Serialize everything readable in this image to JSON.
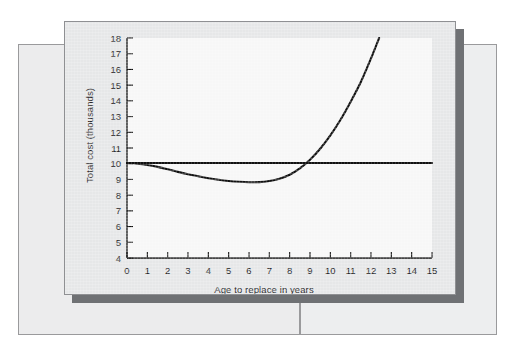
{
  "figure": {
    "kind": "line-chart-figure",
    "card_background": "#e6e7e8",
    "plot_background": "#f7f7f7",
    "shadow_color": "#6f7174",
    "line_color": "#111111"
  },
  "chart_data": {
    "type": "line",
    "title": "",
    "xlabel": "Age to replace in years",
    "ylabel": "Total cost (thousands)",
    "xlim": [
      0,
      15
    ],
    "ylim": [
      4,
      18
    ],
    "xticks": [
      0,
      1,
      2,
      3,
      4,
      5,
      6,
      7,
      8,
      9,
      10,
      11,
      12,
      13,
      14,
      15
    ],
    "yticks": [
      4,
      5,
      6,
      7,
      8,
      9,
      10,
      11,
      12,
      13,
      14,
      15,
      16,
      17,
      18
    ],
    "xtick_labels": [
      "0",
      "1",
      "2",
      "3",
      "4",
      "5",
      "6",
      "7",
      "8",
      "9",
      "10",
      "11",
      "12",
      "13",
      "14",
      "15"
    ],
    "ytick_labels": [
      "4",
      "5",
      "6",
      "7",
      "8",
      "9",
      "10",
      "11",
      "12",
      "13",
      "14",
      "15",
      "16",
      "17",
      "18"
    ],
    "grid": false,
    "legend": null,
    "series": [
      {
        "name": "Reference cost line",
        "style": "straight-horizontal",
        "color": "#111111",
        "x": [
          0,
          15
        ],
        "values": [
          10.05,
          10.05
        ]
      },
      {
        "name": "Total cost curve",
        "style": "smooth-curve",
        "color": "#111111",
        "x": [
          0,
          0.5,
          1,
          1.5,
          2,
          2.5,
          3,
          3.5,
          4,
          4.5,
          5,
          5.5,
          6,
          6.5,
          7,
          7.5,
          8,
          8.5,
          9,
          9.5,
          10,
          10.5,
          11,
          11.5,
          12,
          12.4
        ],
        "values": [
          10.05,
          10.0,
          9.92,
          9.8,
          9.65,
          9.48,
          9.33,
          9.2,
          9.08,
          8.98,
          8.9,
          8.85,
          8.82,
          8.83,
          8.9,
          9.05,
          9.3,
          9.7,
          10.25,
          10.95,
          11.8,
          12.8,
          13.95,
          15.2,
          16.7,
          18.0
        ]
      }
    ],
    "annotations": {
      "curve_minimum": {
        "x": 6.2,
        "y": 8.82
      },
      "crossover_point": {
        "x": 8.7,
        "y": 10.05
      },
      "curve_endpoint": {
        "x": 12.4,
        "y": 18.0
      }
    }
  }
}
